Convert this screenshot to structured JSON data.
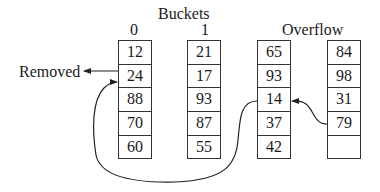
{
  "title": "Buckets",
  "overflow_label": "Overflow",
  "removed_label": "Removed",
  "columns": [
    {
      "header": "0",
      "values": [
        "12",
        "24",
        "88",
        "70",
        "60"
      ]
    },
    {
      "header": "1",
      "values": [
        "21",
        "17",
        "93",
        "87",
        "55"
      ]
    },
    {
      "header": "",
      "values": [
        "65",
        "93",
        "14",
        "37",
        "42"
      ]
    },
    {
      "header": "",
      "values": [
        "84",
        "98",
        "31",
        "79",
        ""
      ]
    }
  ]
}
